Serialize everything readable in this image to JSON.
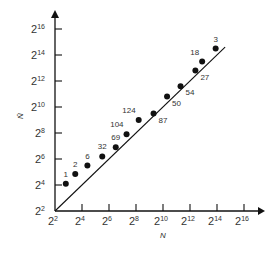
{
  "chart_data": {
    "type": "scatter",
    "title": "",
    "xlabel": "N",
    "ylabel": "N̂",
    "scale": "log2",
    "xlim": [
      2,
      17
    ],
    "ylim": [
      2,
      17
    ],
    "x_ticks": [
      {
        "base": "2",
        "exp": "2"
      },
      {
        "base": "2",
        "exp": "4"
      },
      {
        "base": "2",
        "exp": "6"
      },
      {
        "base": "2",
        "exp": "8"
      },
      {
        "base": "2",
        "exp": "10"
      },
      {
        "base": "2",
        "exp": "12"
      },
      {
        "base": "2",
        "exp": "14"
      },
      {
        "base": "2",
        "exp": "16"
      }
    ],
    "y_ticks": [
      {
        "base": "2",
        "exp": "2"
      },
      {
        "base": "2",
        "exp": "4"
      },
      {
        "base": "2",
        "exp": "6"
      },
      {
        "base": "2",
        "exp": "8"
      },
      {
        "base": "2",
        "exp": "10"
      },
      {
        "base": "2",
        "exp": "12"
      },
      {
        "base": "2",
        "exp": "14"
      },
      {
        "base": "2",
        "exp": "16"
      }
    ],
    "reference_line": {
      "label": "y = x",
      "from_exp": 2,
      "to_exp": 14.6
    },
    "points": [
      {
        "label": "1",
        "x_log2": 2.8,
        "y_log2": 4.1,
        "label_pos": "above"
      },
      {
        "label": "2",
        "x_log2": 3.5,
        "y_log2": 4.85,
        "label_pos": "above"
      },
      {
        "label": "6",
        "x_log2": 4.4,
        "y_log2": 5.5,
        "label_pos": "above"
      },
      {
        "label": "32",
        "x_log2": 5.5,
        "y_log2": 6.2,
        "label_pos": "above"
      },
      {
        "label": "69",
        "x_log2": 6.5,
        "y_log2": 6.9,
        "label_pos": "above"
      },
      {
        "label": "104",
        "x_log2": 7.3,
        "y_log2": 7.9,
        "label_pos": "above-left"
      },
      {
        "label": "124",
        "x_log2": 8.2,
        "y_log2": 9.0,
        "label_pos": "above-left"
      },
      {
        "label": "87",
        "x_log2": 9.3,
        "y_log2": 9.5,
        "label_pos": "below-right"
      },
      {
        "label": "50",
        "x_log2": 10.3,
        "y_log2": 10.8,
        "label_pos": "below-right"
      },
      {
        "label": "54",
        "x_log2": 11.3,
        "y_log2": 11.6,
        "label_pos": "below-right"
      },
      {
        "label": "27",
        "x_log2": 12.4,
        "y_log2": 12.8,
        "label_pos": "below-right"
      },
      {
        "label": "18",
        "x_log2": 12.9,
        "y_log2": 13.5,
        "label_pos": "above-left"
      },
      {
        "label": "3",
        "x_log2": 13.9,
        "y_log2": 14.5,
        "label_pos": "above"
      }
    ],
    "grid": false,
    "legend": null
  },
  "layout": {
    "origin_px": [
      55,
      211
    ],
    "x_px_per_unit": 13.5,
    "y_px_per_unit": 13.0,
    "colors": {
      "axis": "#111111",
      "point": "#111111",
      "text": "#333333"
    }
  }
}
